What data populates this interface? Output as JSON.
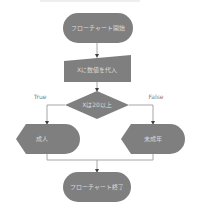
{
  "diagram": {
    "type": "flowchart",
    "colors": {
      "shape_fill": "#7f7f7f",
      "shape_text": "#d9d9d9",
      "connector": "#a6a6a6",
      "arrowhead": "#404040",
      "label_text": "#7f7f7f",
      "background": "#ffffff"
    },
    "nodes": {
      "start": {
        "shape": "terminator",
        "label": "フローチャート開始"
      },
      "input": {
        "shape": "manual-input",
        "label": "Xに数値を代入"
      },
      "decision": {
        "shape": "decision",
        "label": "Xは20以上"
      },
      "adult": {
        "shape": "display",
        "label": "成人"
      },
      "minor": {
        "shape": "display",
        "label": "未成年"
      },
      "end": {
        "shape": "terminator",
        "label": "フローチャート終了"
      }
    },
    "edges": {
      "true_label": "True",
      "false_label": "False"
    }
  }
}
